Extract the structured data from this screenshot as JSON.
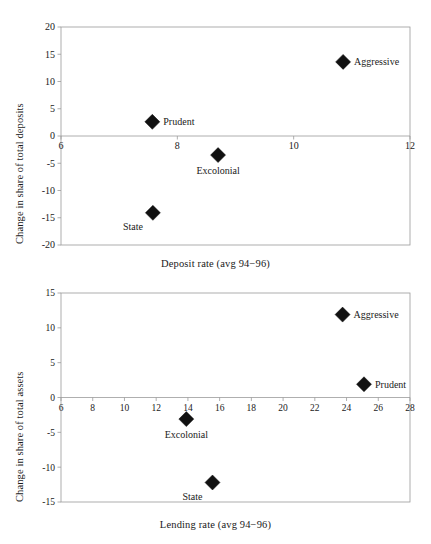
{
  "document": {
    "type": "two-panel-scatter-figure",
    "background_color": "#ffffff",
    "marker_color": "#111111",
    "axis_color": "#9a9a9a",
    "text_color": "#1a1a1a"
  },
  "chart_data": [
    {
      "type": "scatter",
      "title": "",
      "xlabel": "Deposit rate (avg 94−96)",
      "ylabel": "Change in share of total deposits",
      "xlim": [
        6,
        12
      ],
      "ylim": [
        -20,
        20
      ],
      "xticks": [
        6,
        8,
        10,
        12
      ],
      "yticks": [
        20,
        15,
        10,
        5,
        0,
        -5,
        -10,
        -15,
        -20
      ],
      "xtick_labels": [
        "6",
        "8",
        "10",
        "12"
      ],
      "ytick_labels": [
        "20",
        "15",
        "10",
        "5",
        "0",
        "-5",
        "-10",
        "-15",
        "-20"
      ],
      "grid": false,
      "legend": "none",
      "zero_line": true,
      "points": [
        {
          "label": "Aggressive",
          "x": 10.85,
          "y": 13.6,
          "label_position": "right"
        },
        {
          "label": "Prudent",
          "x": 7.57,
          "y": 2.6,
          "label_position": "right"
        },
        {
          "label": "Excolonial",
          "x": 8.7,
          "y": -3.5,
          "label_position": "below"
        },
        {
          "label": "State",
          "x": 7.58,
          "y": -14.1,
          "label_position": "below-left"
        }
      ]
    },
    {
      "type": "scatter",
      "title": "",
      "xlabel": "Lending rate (avg 94−96)",
      "ylabel": "Change in share of total assets",
      "xlim": [
        6,
        28
      ],
      "ylim": [
        -15,
        15
      ],
      "xticks": [
        6,
        8,
        10,
        12,
        14,
        16,
        18,
        20,
        22,
        24,
        26,
        28
      ],
      "yticks": [
        15,
        10,
        5,
        0,
        -5,
        -10,
        -15
      ],
      "xtick_labels": [
        "6",
        "8",
        "10",
        "12",
        "14",
        "16",
        "18",
        "20",
        "22",
        "24",
        "26",
        "28"
      ],
      "ytick_labels": [
        "15",
        "10",
        "5",
        "0",
        "-5",
        "-10",
        "-15"
      ],
      "grid": false,
      "legend": "none",
      "zero_line": true,
      "points": [
        {
          "label": "Aggressive",
          "x": 23.75,
          "y": 11.9,
          "label_position": "right"
        },
        {
          "label": "Prudent",
          "x": 25.1,
          "y": 1.9,
          "label_position": "right"
        },
        {
          "label": "Excolonial",
          "x": 13.9,
          "y": -3.1,
          "label_position": "below"
        },
        {
          "label": "State",
          "x": 15.55,
          "y": -12.2,
          "label_position": "below-left"
        }
      ]
    }
  ],
  "figure1": {
    "x_axis_title": "Deposit rate (avg 94−96)",
    "y_axis_title": "Change in share of total deposits"
  },
  "figure2": {
    "x_axis_title": "Lending rate (avg 94−96)",
    "y_axis_title": "Change in share of total assets"
  }
}
